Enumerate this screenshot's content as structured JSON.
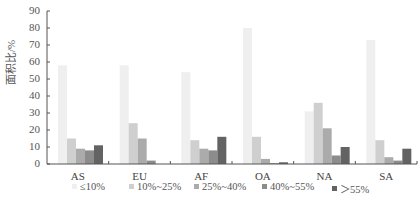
{
  "chart_data": {
    "type": "bar",
    "title": "",
    "xlabel": "",
    "ylabel": "面积比/%",
    "ylim": [
      0,
      90
    ],
    "yticks": [
      0,
      10,
      20,
      30,
      40,
      50,
      60,
      70,
      80,
      90
    ],
    "grid": false,
    "legend_position": "bottom",
    "categories": [
      "AS",
      "EU",
      "AF",
      "OA",
      "NA",
      "SA"
    ],
    "series": [
      {
        "name": "≤10%",
        "color": "#efefef",
        "values": [
          58,
          58,
          54,
          80,
          31,
          73
        ]
      },
      {
        "name": "10%~25%",
        "color": "#cfcfcf",
        "values": [
          15,
          24,
          14,
          16,
          36,
          14
        ]
      },
      {
        "name": "25%~40%",
        "color": "#ababab",
        "values": [
          9,
          15,
          9,
          3,
          21,
          4
        ]
      },
      {
        "name": "40%~55%",
        "color": "#8c8c8c",
        "values": [
          8,
          2,
          8,
          0.5,
          5,
          2
        ]
      },
      {
        "name": "＞55%",
        "color": "#636363",
        "values": [
          11,
          0,
          16,
          1,
          10,
          9
        ]
      }
    ]
  }
}
